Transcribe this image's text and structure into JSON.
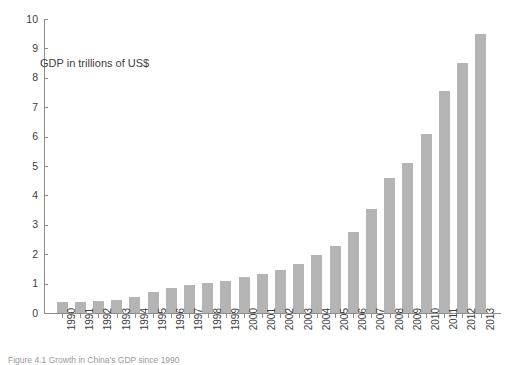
{
  "chart_data": {
    "type": "bar",
    "title": "",
    "annotation": "GDP in trillions of US$",
    "xlabel": "",
    "ylabel": "",
    "ylim": [
      0,
      10
    ],
    "ytick_labels": [
      "10",
      "9",
      "8",
      "7",
      "6",
      "5",
      "4",
      "3",
      "2",
      "1",
      "0"
    ],
    "ytick_values": [
      10,
      9,
      8,
      7,
      6,
      5,
      4,
      3,
      2,
      1,
      0
    ],
    "grid": false,
    "legend": false,
    "bar_color": "#b4b4b4",
    "axis_color": "#8d8d8d",
    "categories": [
      "1990",
      "1991",
      "1992",
      "1993",
      "1994",
      "1995",
      "1996",
      "1997",
      "1998",
      "1999",
      "2000",
      "2001",
      "2002",
      "2003",
      "2004",
      "2005",
      "2006",
      "2007",
      "2008",
      "2009",
      "2010",
      "2011",
      "2012",
      "2013"
    ],
    "values": [
      0.36,
      0.38,
      0.42,
      0.44,
      0.56,
      0.73,
      0.86,
      0.96,
      1.02,
      1.09,
      1.21,
      1.34,
      1.47,
      1.66,
      1.96,
      2.29,
      2.75,
      3.55,
      4.6,
      5.1,
      6.1,
      7.55,
      8.5,
      9.5
    ]
  },
  "caption": {
    "label": "Figure",
    "text": "Figure  4.1  Growth in China's GDP since 1990"
  }
}
